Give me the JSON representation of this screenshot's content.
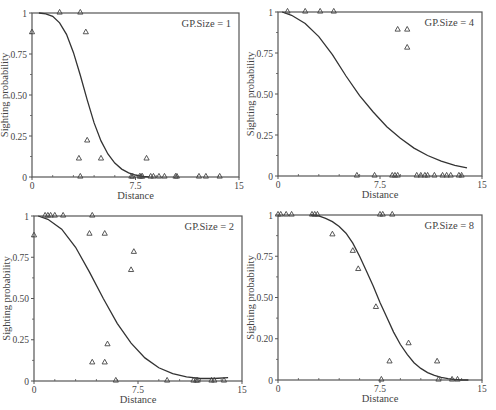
{
  "figure": {
    "style": {
      "line_color": "#333333",
      "frame_color": "#555555",
      "marker_color": "#444444",
      "text_color": "#444444"
    }
  },
  "chart_data": [
    {
      "type": "scatter",
      "title": "GP.Size = 1",
      "xlabel": "Distance",
      "ylabel": "Sighting probability",
      "xlim": [
        0,
        15
      ],
      "ylim": [
        0,
        1
      ],
      "xticks": [
        0,
        7.5,
        15
      ],
      "xtick_labels": [
        "0",
        "7.5",
        "15"
      ],
      "yticks": [
        0,
        0.25,
        0.5,
        0.75,
        1
      ],
      "ytick_labels": [
        "0",
        "0.25",
        "0.50",
        "0.75",
        "1"
      ],
      "grid": false,
      "frame": {
        "left": 32,
        "top": 13,
        "right": 239,
        "bottom": 177
      },
      "points": [
        [
          0.0,
          0.88
        ],
        [
          2.0,
          1.0
        ],
        [
          3.5,
          1.0
        ],
        [
          3.9,
          0.88
        ],
        [
          4.0,
          0.22
        ],
        [
          3.4,
          0.11
        ],
        [
          5.0,
          0.11
        ],
        [
          8.3,
          0.11
        ],
        [
          3.5,
          0.0
        ],
        [
          7.2,
          0.0
        ],
        [
          7.3,
          0.0
        ],
        [
          7.8,
          0.0
        ],
        [
          7.9,
          0.0
        ],
        [
          8.0,
          0.0
        ],
        [
          8.6,
          0.0
        ],
        [
          8.8,
          0.0
        ],
        [
          9.2,
          0.0
        ],
        [
          9.6,
          0.0
        ],
        [
          10.4,
          0.0
        ],
        [
          10.5,
          0.0
        ],
        [
          12.1,
          0.0
        ],
        [
          12.6,
          0.0
        ],
        [
          13.6,
          0.0
        ]
      ],
      "curve": [
        [
          0.5,
          1.0
        ],
        [
          1.0,
          0.995
        ],
        [
          1.5,
          0.98
        ],
        [
          2.0,
          0.94
        ],
        [
          2.5,
          0.87
        ],
        [
          3.0,
          0.76
        ],
        [
          3.5,
          0.62
        ],
        [
          4.0,
          0.47
        ],
        [
          4.5,
          0.33
        ],
        [
          5.0,
          0.22
        ],
        [
          5.5,
          0.14
        ],
        [
          6.0,
          0.085
        ],
        [
          6.5,
          0.048
        ],
        [
          7.0,
          0.025
        ],
        [
          7.5,
          0.012
        ],
        [
          8.0,
          0.004
        ],
        [
          8.5,
          0.0
        ]
      ]
    },
    {
      "type": "scatter",
      "title": "GP.Size = 4",
      "xlabel": "Distance",
      "ylabel": "Sighting probability",
      "xlim": [
        0,
        15
      ],
      "ylim": [
        0,
        1
      ],
      "xticks": [
        0,
        7.5,
        15
      ],
      "xtick_labels": [
        "0",
        "7.5",
        "15"
      ],
      "yticks": [
        0,
        0.25,
        0.5,
        0.75,
        1
      ],
      "ytick_labels": [
        "0",
        "0.25",
        "0.50",
        "0.75",
        "1"
      ],
      "grid": false,
      "frame": {
        "left": 278,
        "top": 12,
        "right": 482,
        "bottom": 176
      },
      "points": [
        [
          0.7,
          1.0
        ],
        [
          2.0,
          1.0
        ],
        [
          3.1,
          1.0
        ],
        [
          4.1,
          1.0
        ],
        [
          8.8,
          0.89
        ],
        [
          9.5,
          0.89
        ],
        [
          9.5,
          0.78
        ],
        [
          5.8,
          0.0
        ],
        [
          7.1,
          0.0
        ],
        [
          8.4,
          0.0
        ],
        [
          8.6,
          0.0
        ],
        [
          8.8,
          0.0
        ],
        [
          10.2,
          0.0
        ],
        [
          10.5,
          0.0
        ],
        [
          10.8,
          0.0
        ],
        [
          11.0,
          0.0
        ],
        [
          11.5,
          0.0
        ],
        [
          12.1,
          0.0
        ],
        [
          12.4,
          0.0
        ],
        [
          12.7,
          0.0
        ],
        [
          13.3,
          0.0
        ],
        [
          13.5,
          0.0
        ]
      ],
      "curve": [
        [
          0.3,
          1.0
        ],
        [
          1.0,
          0.98
        ],
        [
          2.0,
          0.93
        ],
        [
          3.0,
          0.85
        ],
        [
          4.0,
          0.74
        ],
        [
          5.0,
          0.61
        ],
        [
          6.0,
          0.49
        ],
        [
          7.0,
          0.39
        ],
        [
          8.0,
          0.3
        ],
        [
          9.0,
          0.23
        ],
        [
          10.0,
          0.17
        ],
        [
          11.0,
          0.125
        ],
        [
          12.0,
          0.09
        ],
        [
          13.0,
          0.065
        ],
        [
          13.9,
          0.05
        ]
      ]
    },
    {
      "type": "scatter",
      "title": "GP.Size = 2",
      "xlabel": "Distance",
      "ylabel": "Sighting probability",
      "xlim": [
        0,
        15
      ],
      "ylim": [
        0,
        1
      ],
      "xticks": [
        0,
        7.5,
        15
      ],
      "xtick_labels": [
        "0",
        "7.5",
        "15"
      ],
      "yticks": [
        0,
        0.25,
        0.5,
        0.75,
        1
      ],
      "ytick_labels": [
        "0",
        "0.25",
        "0.50",
        "0.75",
        "1"
      ],
      "grid": false,
      "frame": {
        "left": 34,
        "top": 216,
        "right": 242,
        "bottom": 381
      },
      "points": [
        [
          0.0,
          0.88
        ],
        [
          0.8,
          1.0
        ],
        [
          1.0,
          1.0
        ],
        [
          1.2,
          1.0
        ],
        [
          1.5,
          1.0
        ],
        [
          2.1,
          1.0
        ],
        [
          4.2,
          1.0
        ],
        [
          4.0,
          0.89
        ],
        [
          5.1,
          0.89
        ],
        [
          7.2,
          0.78
        ],
        [
          7.0,
          0.67
        ],
        [
          5.3,
          0.22
        ],
        [
          4.2,
          0.11
        ],
        [
          5.1,
          0.11
        ],
        [
          5.9,
          0.0
        ],
        [
          9.6,
          0.0
        ],
        [
          11.5,
          0.0
        ],
        [
          11.7,
          0.0
        ],
        [
          11.8,
          0.0
        ],
        [
          12.8,
          0.0
        ],
        [
          13.0,
          0.0
        ],
        [
          13.7,
          0.0
        ]
      ],
      "curve": [
        [
          0.3,
          1.0
        ],
        [
          1.0,
          0.98
        ],
        [
          2.0,
          0.92
        ],
        [
          3.0,
          0.81
        ],
        [
          4.0,
          0.66
        ],
        [
          5.0,
          0.5
        ],
        [
          6.0,
          0.35
        ],
        [
          7.0,
          0.23
        ],
        [
          8.0,
          0.14
        ],
        [
          9.0,
          0.08
        ],
        [
          10.0,
          0.045
        ],
        [
          11.0,
          0.025
        ],
        [
          12.0,
          0.015
        ],
        [
          13.0,
          0.015
        ],
        [
          14.0,
          0.02
        ]
      ]
    },
    {
      "type": "scatter",
      "title": "GP.Size = 8",
      "xlabel": "Distance",
      "ylabel": "Sighting probability",
      "xlim": [
        0,
        15
      ],
      "ylim": [
        0,
        1
      ],
      "xticks": [
        0,
        7.5,
        15
      ],
      "xtick_labels": [
        "0",
        "7.5",
        "15"
      ],
      "yticks": [
        0,
        0.25,
        0.5,
        0.75,
        1
      ],
      "ytick_labels": [
        "0",
        "0.20",
        "0.50",
        "0.75",
        "1"
      ],
      "grid": false,
      "frame": {
        "left": 278,
        "top": 215,
        "right": 482,
        "bottom": 380
      },
      "points": [
        [
          0.0,
          1.0
        ],
        [
          0.2,
          1.0
        ],
        [
          0.6,
          1.0
        ],
        [
          1.0,
          1.0
        ],
        [
          2.5,
          1.0
        ],
        [
          2.7,
          1.0
        ],
        [
          2.9,
          1.0
        ],
        [
          7.5,
          1.0
        ],
        [
          7.7,
          1.0
        ],
        [
          8.4,
          1.0
        ],
        [
          4.0,
          0.88
        ],
        [
          5.5,
          0.78
        ],
        [
          5.9,
          0.67
        ],
        [
          7.2,
          0.44
        ],
        [
          9.6,
          0.22
        ],
        [
          8.2,
          0.11
        ],
        [
          11.7,
          0.11
        ],
        [
          7.6,
          0.0
        ],
        [
          11.8,
          0.0
        ],
        [
          12.8,
          0.0
        ],
        [
          13.2,
          0.0
        ]
      ],
      "curve": [
        [
          2.4,
          1.0
        ],
        [
          3.0,
          0.995
        ],
        [
          3.5,
          0.98
        ],
        [
          4.0,
          0.96
        ],
        [
          4.5,
          0.93
        ],
        [
          5.0,
          0.89
        ],
        [
          5.5,
          0.83
        ],
        [
          6.0,
          0.75
        ],
        [
          6.5,
          0.66
        ],
        [
          7.0,
          0.57
        ],
        [
          7.5,
          0.47
        ],
        [
          8.0,
          0.38
        ],
        [
          8.5,
          0.29
        ],
        [
          9.0,
          0.215
        ],
        [
          9.5,
          0.155
        ],
        [
          10.0,
          0.105
        ],
        [
          10.5,
          0.07
        ],
        [
          11.0,
          0.045
        ],
        [
          11.5,
          0.028
        ],
        [
          12.0,
          0.016
        ],
        [
          12.5,
          0.008
        ],
        [
          13.0,
          0.003
        ],
        [
          13.5,
          0.0
        ],
        [
          14.0,
          0.0
        ]
      ]
    }
  ]
}
